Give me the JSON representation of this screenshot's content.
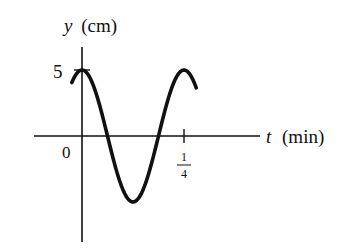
{
  "chart_data": {
    "type": "line",
    "title": "",
    "xlabel": "t (min)",
    "ylabel": "y (cm)",
    "x_var": "t",
    "x_unit": "(min)",
    "y_var": "y",
    "y_unit": "(cm)",
    "origin_label": "0",
    "y_tick_labels": [
      "5"
    ],
    "y_ticks": [
      5
    ],
    "x_tick_labels": [
      {
        "numerator": "1",
        "denominator": "4"
      }
    ],
    "x_ticks": [
      0.25
    ],
    "function": "y = 5 cos(8πt)",
    "amplitude": 5,
    "period": 0.25,
    "x": [
      -0.025,
      0,
      0.03125,
      0.0625,
      0.09375,
      0.125,
      0.15625,
      0.1875,
      0.21875,
      0.25,
      0.28
    ],
    "values": [
      3.54,
      5,
      3.54,
      0,
      -3.54,
      -5,
      -3.54,
      0,
      3.54,
      5,
      3.1
    ],
    "xlim": [
      -0.15,
      0.44
    ],
    "ylim": [
      -8,
      6.8
    ],
    "grid": false,
    "legend": null
  },
  "colors": {
    "ink": "#111111",
    "background": "#ffffff"
  }
}
